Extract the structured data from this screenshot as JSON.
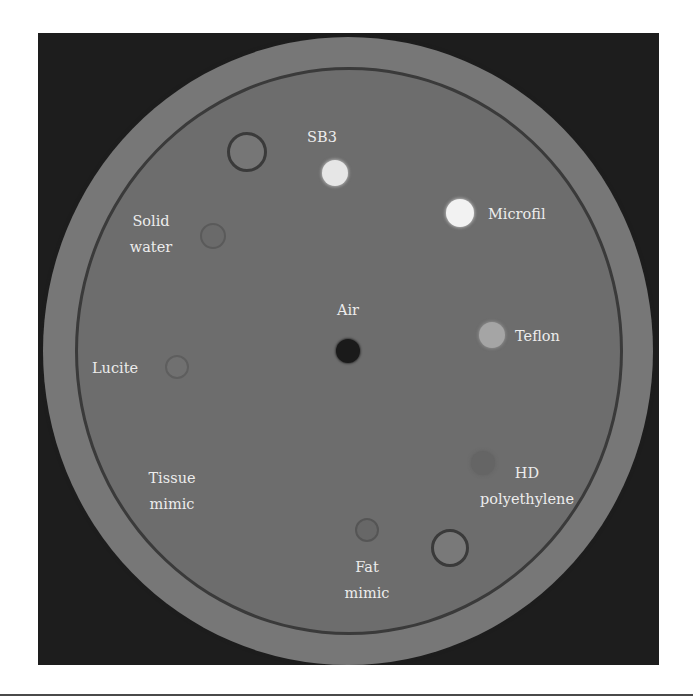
{
  "figure": {
    "type": "CT scan cross-section of calibration phantom",
    "colors": {
      "background": "#1d1d1d",
      "outer_ring": "#777777",
      "inner_disc": "#6d6d6d",
      "ring_line": "#3a3a3a",
      "label_text": "#ececec"
    }
  },
  "inserts": [
    {
      "id": "unlabeled-top",
      "label": "",
      "cx": 247,
      "cy": 152,
      "r": 20,
      "fill": "#767676",
      "border": "#3a3a3a"
    },
    {
      "id": "sb3",
      "label": "SB3",
      "cx": 335,
      "cy": 173,
      "r": 13,
      "fill": "#e6e6e6",
      "border": "none"
    },
    {
      "id": "microfil",
      "label": "Microfil",
      "cx": 460,
      "cy": 213,
      "r": 14,
      "fill": "#f2f2f2",
      "border": "none"
    },
    {
      "id": "solid-water",
      "label": "Solid water",
      "cx": 213,
      "cy": 236,
      "r": 13,
      "fill": "#6a6a6a",
      "border": "#585858"
    },
    {
      "id": "air",
      "label": "Air",
      "cx": 348,
      "cy": 351,
      "r": 12,
      "fill": "#1a1a1a",
      "border": "none"
    },
    {
      "id": "teflon",
      "label": "Teflon",
      "cx": 492,
      "cy": 335,
      "r": 13,
      "fill": "#a5a5a5",
      "border": "none"
    },
    {
      "id": "lucite",
      "label": "Lucite",
      "cx": 177,
      "cy": 367,
      "r": 12,
      "fill": "#707070",
      "border": "#5c5c5c"
    },
    {
      "id": "hd-polyethylene",
      "label": "HD polyethylene",
      "cx": 483,
      "cy": 463,
      "r": 12,
      "fill": "#666666",
      "border": "none"
    },
    {
      "id": "fat-mimic",
      "label": "Fat mimic",
      "cx": 367,
      "cy": 530,
      "r": 12,
      "fill": "#666666",
      "border": "#555555"
    },
    {
      "id": "unlabeled-bottom",
      "label": "",
      "cx": 450,
      "cy": 548,
      "r": 19,
      "fill": "#797979",
      "border": "#3a3a3a"
    }
  ],
  "labels": {
    "sb3": "SB3",
    "microfil": "Microfil",
    "solid_water_line1": "Solid",
    "solid_water_line2": "water",
    "air": "Air",
    "teflon": "Teflon",
    "lucite": "Lucite",
    "tissue_mimic_line1": "Tissue",
    "tissue_mimic_line2": "mimic",
    "hd_polyethylene_line1": "HD",
    "hd_polyethylene_line2": "polyethylene",
    "fat_mimic_line1": "Fat",
    "fat_mimic_line2": "mimic"
  }
}
